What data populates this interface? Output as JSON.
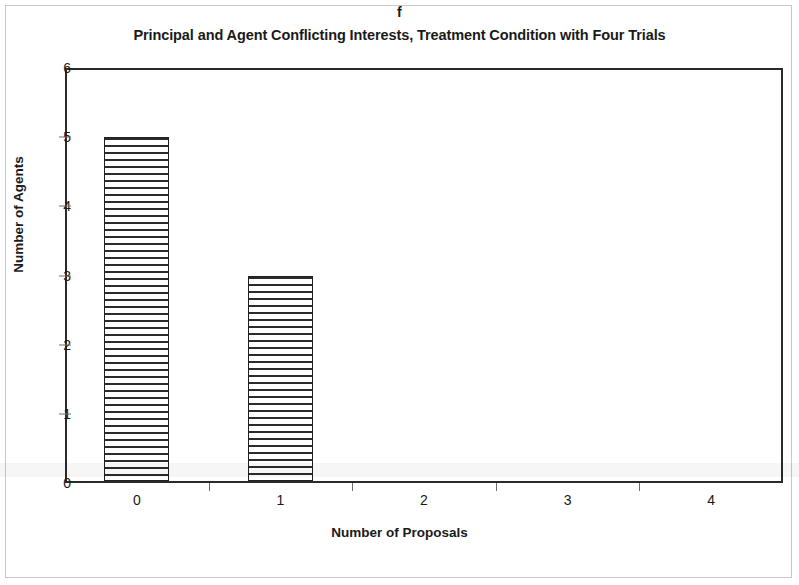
{
  "panel": {
    "letter": "f"
  },
  "chart_data": {
    "type": "bar",
    "title": "Principal and Agent Conflicting Interests, Treatment Condition with Four Trials",
    "subtitle": "",
    "xlabel": "Number of Proposals",
    "ylabel": "Number of Agents",
    "categories": [
      "0",
      "1",
      "2",
      "3",
      "4"
    ],
    "values": [
      5,
      3,
      0,
      0,
      0
    ],
    "ylim": [
      0,
      6
    ],
    "yticks": [
      "0",
      "1",
      "2",
      "3",
      "4",
      "5",
      "6"
    ],
    "xticks": [
      "0",
      "1",
      "2",
      "3",
      "4"
    ],
    "grid": false,
    "legend": null,
    "legend_position": "none",
    "bar_fill": "horizontal-hatch",
    "colors": {
      "bar_outline": "#202020",
      "bar_hatch": "#2b2b2b",
      "bar_background": "#ffffff",
      "axis": "#2a2a2a",
      "tick": "#6e6e6e",
      "text": "#1a1a1a",
      "page_border": "#c9c9c9",
      "plot_background": "#ffffff"
    }
  }
}
